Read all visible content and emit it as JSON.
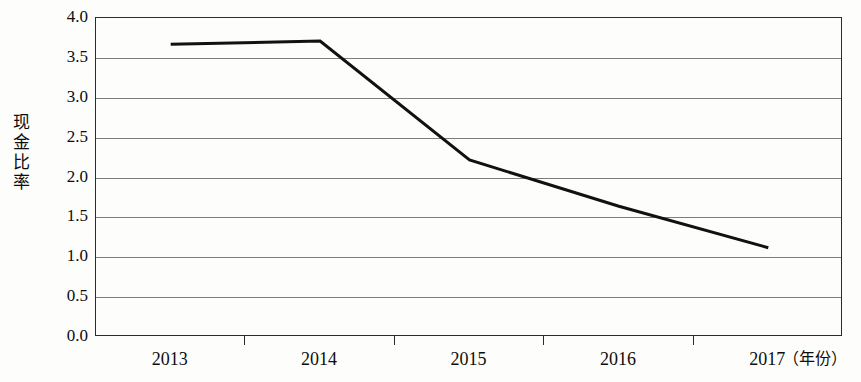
{
  "chart_data": {
    "type": "line",
    "title": "",
    "subtitle": "",
    "xlabel": "年份",
    "ylabel": "现金比率",
    "x_unit_note": "（年份）",
    "categories": [
      "2013",
      "2014",
      "2015",
      "2016",
      "2017"
    ],
    "series": [
      {
        "name": "现金比率",
        "values": [
          3.67,
          3.71,
          2.22,
          1.64,
          1.12
        ],
        "color": "#111111",
        "line_width": 3
      }
    ],
    "ylim": [
      0.0,
      4.0
    ],
    "ytick_labels": [
      "4.0",
      "3.5",
      "3.0",
      "2.5",
      "2.0",
      "1.5",
      "1.0",
      "0.5",
      "0.0"
    ],
    "ytick_values": [
      4.0,
      3.5,
      3.0,
      2.5,
      2.0,
      1.5,
      1.0,
      0.5,
      0.0
    ],
    "grid": true,
    "grid_axis": "y",
    "legend": false,
    "legend_position": "none",
    "markers": false,
    "frame": true,
    "annotations": []
  },
  "axis": {
    "y_title_chars": [
      "现",
      "金",
      "比",
      "率"
    ]
  },
  "colors": {
    "line": "#111111",
    "grid": "#7d7d7d",
    "frame": "#2b2b2b",
    "background": "#fdfdfb",
    "text": "#0d0d0d"
  }
}
